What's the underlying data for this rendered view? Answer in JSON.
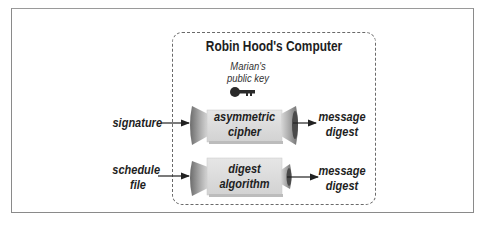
{
  "diagram": {
    "container_title": "Robin Hood's Computer",
    "key": {
      "label_line1": "Marian's",
      "label_line2": "public key",
      "icon": "key-icon"
    },
    "rows": [
      {
        "input_line1": "signature",
        "input_line2": "",
        "process_line1": "asymmetric",
        "process_line2": "cipher",
        "output_line1": "message",
        "output_line2": "digest"
      },
      {
        "input_line1": "schedule",
        "input_line2": "file",
        "process_line1": "digest",
        "process_line2": "algorithm",
        "output_line1": "message",
        "output_line2": "digest"
      }
    ],
    "colors": {
      "frame": "#8a8a8a",
      "dashed_border": "#6a6a6a",
      "box_fill": "#dcdcdc",
      "text": "#1e1e1e"
    }
  }
}
